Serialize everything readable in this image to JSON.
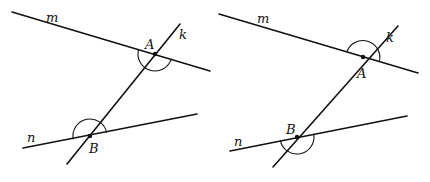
{
  "diagram": {
    "colors": {
      "stroke": "#111111",
      "background": "#ffffff"
    },
    "figures": [
      {
        "id": "left",
        "lines": {
          "m": "m",
          "k": "k",
          "n": "n"
        },
        "points": {
          "A": "A",
          "B": "B"
        },
        "angle_marks": [
          "straight/obtuse arc below m at A",
          "arc above n at B"
        ]
      },
      {
        "id": "right",
        "lines": {
          "m": "m",
          "k": "k",
          "n": "n"
        },
        "points": {
          "A": "A",
          "B": "B"
        },
        "angle_marks": [
          "arc above m at A",
          "arc below n at B"
        ]
      }
    ]
  }
}
